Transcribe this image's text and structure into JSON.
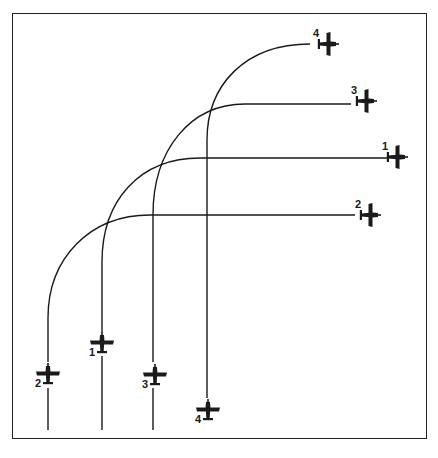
{
  "diagram": {
    "type": "flight-maneuver",
    "colors": {
      "ink": "#1a1a1a",
      "background": "#ffffff"
    },
    "start_positions": [
      {
        "id": "1",
        "label": "1",
        "x": 102,
        "y": 343,
        "heading": "north"
      },
      {
        "id": "2",
        "label": "2",
        "x": 48,
        "y": 374,
        "heading": "north"
      },
      {
        "id": "3",
        "label": "3",
        "x": 155,
        "y": 375,
        "heading": "north"
      },
      {
        "id": "4",
        "label": "4",
        "x": 208,
        "y": 410,
        "heading": "north"
      }
    ],
    "end_positions": [
      {
        "id": "4",
        "label": "4",
        "x": 328,
        "y": 44,
        "heading": "east"
      },
      {
        "id": "3",
        "label": "3",
        "x": 366,
        "y": 101,
        "heading": "east"
      },
      {
        "id": "1",
        "label": "1",
        "x": 397,
        "y": 157,
        "heading": "east"
      },
      {
        "id": "2",
        "label": "2",
        "x": 370,
        "y": 215,
        "heading": "east"
      }
    ],
    "paths": [
      {
        "id": "2",
        "d": "M48,430 L48,388 M48,362 L48,318 C48,258 90,215 150,215 L355,215"
      },
      {
        "id": "1",
        "d": "M102,430 L102,356 M102,332 L102,262 C102,200 140,158 200,158 L387,158"
      },
      {
        "id": "3",
        "d": "M153,430 L153,388 M153,362 L153,215 C153,150 190,104 245,104 L351,104"
      },
      {
        "id": "4",
        "d": "M207,398 L207,140 C207,85 245,44 310,44"
      }
    ]
  }
}
